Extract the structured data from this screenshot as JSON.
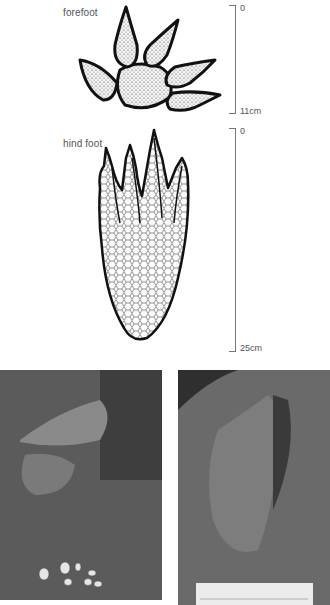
{
  "illustrations": {
    "forefoot": {
      "label": "forefoot",
      "scale_top": "0",
      "scale_bottom": "11cm"
    },
    "hind_foot": {
      "label": "hind foot",
      "scale_top": "0",
      "scale_bottom": "25cm"
    }
  },
  "photos": {
    "left": {
      "subject": "crocodile beside nest with hatched eggs"
    },
    "right": {
      "subject": "crocodile hind foot track in mud with ruler"
    }
  },
  "colors": {
    "ink": "#1a1a1a",
    "scale_line": "#777777",
    "label_text": "#555555"
  }
}
